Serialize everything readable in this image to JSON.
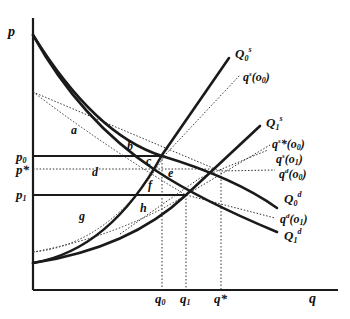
{
  "diagram": {
    "axes": {
      "y_label": "p",
      "x_label": "q"
    },
    "price_labels": {
      "p0": "p",
      "p0_sub": "0",
      "pstar": "p*",
      "p1": "p",
      "p1_sub": "1"
    },
    "quantity_labels": {
      "q0": "q",
      "q0_sub": "0",
      "q1": "q",
      "q1_sub": "1",
      "qstar": "q*"
    },
    "curves": {
      "Q0s": {
        "main": "Q",
        "sub": "0",
        "sup": "s"
      },
      "qs_o0": {
        "main": "q",
        "sup": "s",
        "arg": "(o",
        "arg_sub": "0",
        "close": ")"
      },
      "Q1s": {
        "main": "Q",
        "sub": "1",
        "sup": "s"
      },
      "qsstar_o0": {
        "main": "q",
        "sup": "s",
        "star": "*",
        "arg": "(o",
        "arg_sub": "0",
        "close": ")"
      },
      "qs_o1": {
        "main": "q",
        "sup": "s",
        "arg": "(o",
        "arg_sub": "1",
        "close": ")"
      },
      "qd_o0": {
        "main": "q",
        "sup": "d",
        "arg": "(o",
        "arg_sub": "0",
        "close": ")"
      },
      "Q0d": {
        "main": "Q",
        "sub": "0",
        "sup": "d"
      },
      "qd_o1": {
        "main": "q",
        "sup": "d",
        "arg": "(o",
        "arg_sub": "1",
        "close": ")"
      },
      "Q1d": {
        "main": "Q",
        "sub": "1",
        "sup": "d"
      }
    },
    "area_labels": {
      "a": "a",
      "b": "b",
      "c": "c",
      "d": "d",
      "e": "e",
      "f": "f",
      "g": "g",
      "h": "h"
    }
  }
}
